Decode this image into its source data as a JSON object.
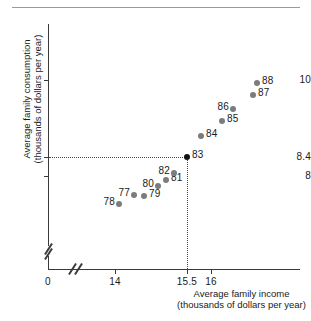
{
  "chart_data": {
    "type": "scatter",
    "title": "",
    "xlabel": "Average family income (thousands of dollars per year)",
    "xlabel_line1": "Average family income",
    "xlabel_line2": "(thousands of dollars per year)",
    "ylabel": "Average family consumption (thousands of dollars per year)",
    "ylabel_line1": "Average family consumption",
    "ylabel_line2": "(thousands of dollars per year)",
    "x_ticks": [
      "0",
      "14",
      "15.5",
      "16"
    ],
    "y_ticks": [
      "10",
      "8.4",
      "8"
    ],
    "xlim": [
      13.5,
      17.2
    ],
    "ylim": [
      7.4,
      10.9
    ],
    "grid": false,
    "legend": null,
    "axis_breaks": [
      "x",
      "y"
    ],
    "highlight_point": "83",
    "highlight_color": "#111111",
    "point_color": "#7c7c7c",
    "guides": {
      "horizontal_at_y": "8.4",
      "vertical_at_x": "15.5"
    },
    "points": [
      {
        "label": "78",
        "x": 14.15,
        "y": 7.72,
        "label_side": "left"
      },
      {
        "label": "77",
        "x": 14.48,
        "y": 7.85,
        "label_side": "left"
      },
      {
        "label": "79",
        "x": 14.65,
        "y": 7.84,
        "label_side": "right"
      },
      {
        "label": "80",
        "x": 14.92,
        "y": 7.97,
        "label_side": "left"
      },
      {
        "label": "81",
        "x": 15.1,
        "y": 8.06,
        "label_side": "right"
      },
      {
        "label": "82",
        "x": 15.24,
        "y": 8.17,
        "label_side": "left"
      },
      {
        "label": "83",
        "x": 15.5,
        "y": 8.4,
        "label_side": "right"
      },
      {
        "label": "84",
        "x": 15.78,
        "y": 8.83,
        "label_side": "right"
      },
      {
        "label": "85",
        "x": 16.18,
        "y": 9.08,
        "label_side": "right"
      },
      {
        "label": "86",
        "x": 16.4,
        "y": 9.25,
        "label_side": "left"
      },
      {
        "label": "87",
        "x": 17.0,
        "y": 9.55,
        "label_side": "right"
      },
      {
        "label": "88",
        "x": 17.08,
        "y": 9.75,
        "label_side": "right"
      }
    ]
  },
  "axis": {
    "y_ticks": [
      {
        "value": "10",
        "top": 80
      },
      {
        "value": "8.4",
        "top": 157
      },
      {
        "value": "8",
        "top": 176
      }
    ],
    "x_ticks": [
      {
        "value": "0",
        "left": 48
      },
      {
        "value": "14",
        "left": 115
      },
      {
        "value": "15.5",
        "left": 187
      },
      {
        "value": "16",
        "left": 211
      }
    ]
  },
  "plot_points": [
    {
      "name": "point-78",
      "label": "78",
      "cx": 119,
      "cy": 204,
      "side": "left",
      "color": "#7c7c7c"
    },
    {
      "name": "point-77",
      "label": "77",
      "cx": 134,
      "cy": 195,
      "side": "left",
      "color": "#7c7c7c"
    },
    {
      "name": "point-79",
      "label": "79",
      "cx": 144,
      "cy": 196,
      "side": "right",
      "color": "#7c7c7c"
    },
    {
      "name": "point-80",
      "label": "80",
      "cx": 158,
      "cy": 186,
      "side": "left",
      "color": "#7c7c7c"
    },
    {
      "name": "point-81",
      "label": "81",
      "cx": 166,
      "cy": 180,
      "side": "right",
      "color": "#7c7c7c"
    },
    {
      "name": "point-82",
      "label": "82",
      "cx": 174,
      "cy": 173,
      "side": "left",
      "color": "#7c7c7c"
    },
    {
      "name": "point-83",
      "label": "83",
      "cx": 187,
      "cy": 157,
      "side": "right",
      "color": "#111111"
    },
    {
      "name": "point-84",
      "label": "84",
      "cx": 201,
      "cy": 136,
      "side": "right",
      "color": "#7c7c7c"
    },
    {
      "name": "point-85",
      "label": "85",
      "cx": 222,
      "cy": 121,
      "side": "right",
      "color": "#7c7c7c"
    },
    {
      "name": "point-86",
      "label": "86",
      "cx": 233,
      "cy": 109,
      "side": "left",
      "color": "#7c7c7c"
    },
    {
      "name": "point-87",
      "label": "87",
      "cx": 253,
      "cy": 95,
      "side": "right",
      "color": "#7c7c7c"
    },
    {
      "name": "point-88",
      "label": "88",
      "cx": 257,
      "cy": 83,
      "side": "right",
      "color": "#7c7c7c"
    }
  ]
}
